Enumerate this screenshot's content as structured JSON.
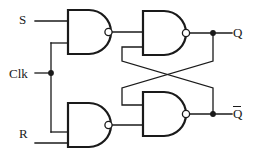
{
  "figure": {
    "line_color": "#1a1a1a",
    "fill_color": "#ffffff",
    "background": "#ffffff"
  },
  "labels": {
    "s": "S",
    "clk": "Clk",
    "r": "R",
    "q": "Q",
    "q_bar": "Q",
    "q_bar_overline": true
  },
  "gates": [
    {
      "id": "gate-s-nand",
      "name": "nand-gate-set",
      "type": "NAND",
      "inputs": [
        "S",
        "Clk"
      ],
      "output": "set-internal"
    },
    {
      "id": "gate-q-nand",
      "name": "nand-gate-q",
      "type": "NAND",
      "inputs": [
        "set-internal",
        "Q-bar"
      ],
      "output": "Q"
    },
    {
      "id": "gate-r-nand",
      "name": "nand-gate-reset",
      "type": "NAND",
      "inputs": [
        "Clk",
        "R"
      ],
      "output": "reset-internal"
    },
    {
      "id": "gate-qb-nand",
      "name": "nand-gate-q-bar",
      "type": "NAND",
      "inputs": [
        "Q",
        "reset-internal"
      ],
      "output": "Q-bar"
    }
  ],
  "nodes": [
    {
      "name": "clk-junction",
      "x": 51,
      "y": 73
    },
    {
      "name": "q-junction",
      "x": 213,
      "y": 33
    },
    {
      "name": "q-bar-junction",
      "x": 213,
      "y": 114
    },
    {
      "name": "cross-center",
      "x": 168,
      "y": 74
    }
  ]
}
